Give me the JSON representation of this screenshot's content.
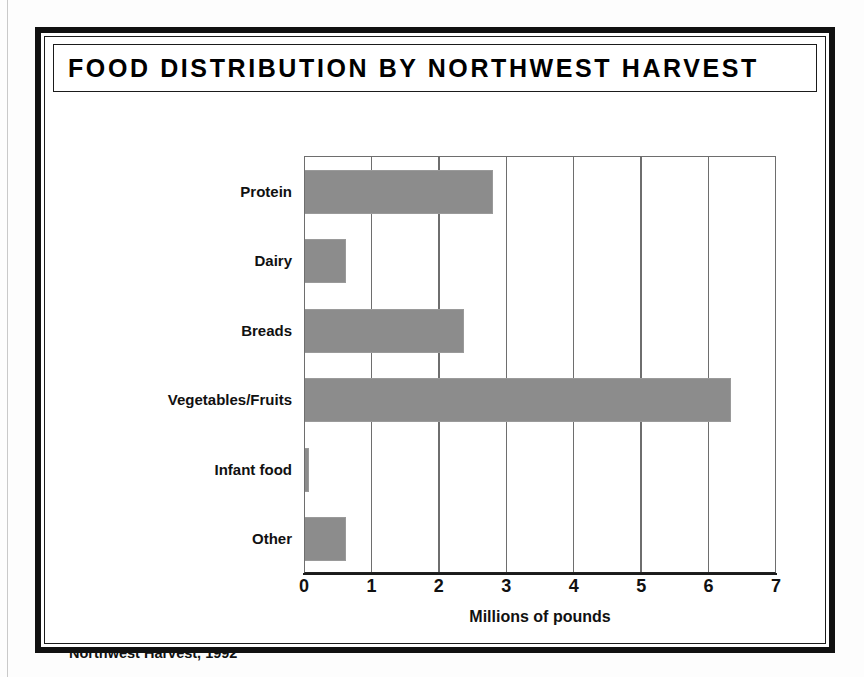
{
  "figure": {
    "title": "FOOD DISTRIBUTION BY NORTHWEST HARVEST",
    "source_note": "Northwest Harvest, 1992",
    "frame_color": "#111111",
    "bar_color": "#8c8c8c",
    "grid_color": "#6e6e6e"
  },
  "chart_data": {
    "type": "bar",
    "orientation": "horizontal",
    "title": "FOOD DISTRIBUTION BY NORTHWEST HARVEST",
    "categories": [
      "Protein",
      "Dairy",
      "Breads",
      "Vegetables/Fruits",
      "Infant food",
      "Other"
    ],
    "values": [
      2.8,
      0.62,
      2.38,
      6.33,
      0.07,
      0.62
    ],
    "xlabel": "Millions of pounds",
    "ylabel": "",
    "xlim": [
      0,
      7
    ],
    "xticks": [
      0,
      1,
      2,
      3,
      4,
      5,
      6,
      7
    ],
    "xtick_labels": [
      "0",
      "1",
      "2",
      "3",
      "4",
      "5",
      "6",
      "7"
    ],
    "grid": true,
    "grid_axis": "x",
    "legend": false,
    "annotation": "Northwest Harvest, 1992"
  }
}
